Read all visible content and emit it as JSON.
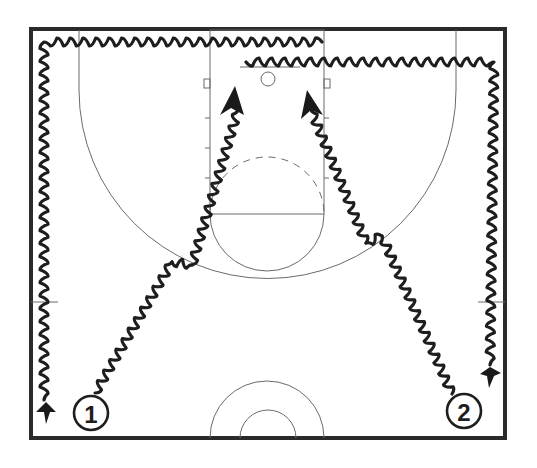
{
  "diagram": {
    "type": "basketball-half-court-drill",
    "colors": {
      "background": "#ffffff",
      "court_lines": "#6a6a6a",
      "border": "#2a2a2a",
      "dribble_path": "#1e1e1e"
    },
    "players": [
      {
        "id": "player-1",
        "label": "1",
        "x": 91,
        "y": 413
      },
      {
        "id": "player-2",
        "label": "2",
        "x": 464,
        "y": 411
      }
    ],
    "paths": [
      {
        "id": "player-1-baseline-dribble",
        "description": "Dribble along top baseline, down left sideline to bottom-left corner"
      },
      {
        "id": "player-2-baseline-dribble",
        "description": "Dribble along top baseline, down right sideline to bottom-right area"
      },
      {
        "id": "player-1-drive",
        "description": "Dribble from player 1 to left elbow with crossover, drive to left block"
      },
      {
        "id": "player-2-drive",
        "description": "Dribble from player 2 to right elbow with crossover, drive to right block"
      }
    ]
  }
}
